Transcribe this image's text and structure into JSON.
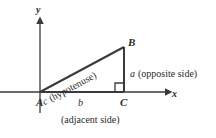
{
  "figure": {
    "line_color": "#3a3a3a",
    "background": "#ffffff"
  },
  "axes": {
    "x_label": "x",
    "y_label": "y",
    "origin_vertex": "A"
  },
  "vertices": {
    "a_label": "A",
    "b_label": "B",
    "c_label": "C"
  },
  "sides": {
    "hypotenuse": {
      "var": "c",
      "note": "(hypotenuse)"
    },
    "opposite": {
      "var": "a",
      "note": "(opposite side)"
    },
    "adjacent": {
      "var": "b",
      "note": "(adjacent side)"
    }
  },
  "markers": {
    "right_angle_at": "C"
  },
  "geometry": {
    "A": [
      40,
      92
    ],
    "B": [
      124,
      47
    ],
    "C": [
      124,
      92
    ],
    "x_axis_from": [
      0,
      92
    ],
    "x_axis_to": [
      168,
      92
    ],
    "y_axis_from": [
      40,
      112
    ],
    "y_axis_to": [
      40,
      20
    ]
  }
}
